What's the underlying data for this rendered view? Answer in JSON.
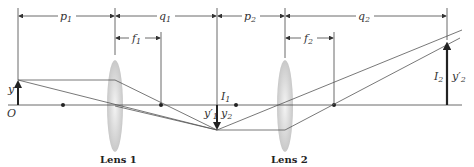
{
  "diagram": {
    "lenses": [
      {
        "id": "lens1",
        "label": "Lens 1",
        "focal_label": "f",
        "focal_sub": "1"
      },
      {
        "id": "lens2",
        "label": "Lens 2",
        "focal_label": "f",
        "focal_sub": "2"
      }
    ],
    "dimensions": [
      {
        "id": "p1",
        "label": "p",
        "sub": "1"
      },
      {
        "id": "q1",
        "label": "q",
        "sub": "1"
      },
      {
        "id": "p2",
        "label": "p",
        "sub": "2"
      },
      {
        "id": "q2",
        "label": "q",
        "sub": "2"
      }
    ],
    "labels": {
      "origin": "O",
      "object_height": "y",
      "image1": "I",
      "image1_sub": "1",
      "image1_height": "y′",
      "image1_height_sub": "1",
      "object2_height": "y",
      "object2_height_sub": "2",
      "image2": "I",
      "image2_sub": "2",
      "image2_height": "y′",
      "image2_height_sub": "2"
    },
    "colors": {
      "line": "#444444",
      "arrow": "#222222",
      "lens": "#d0d0d0"
    }
  }
}
